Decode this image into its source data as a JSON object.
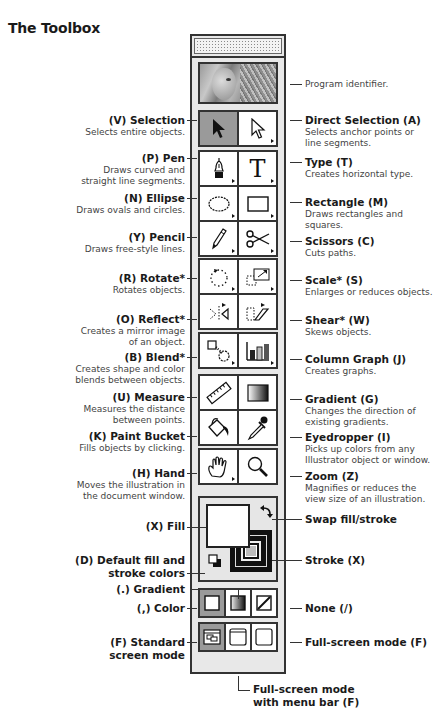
{
  "title": "The Toolbox",
  "program_identifier": "Program identifier.",
  "left_labels": [
    {
      "title": "(V) Selection",
      "desc": [
        "Selects entire objects."
      ]
    },
    {
      "title": "(P) Pen",
      "desc": [
        "Draws curved and",
        "straight line segments."
      ]
    },
    {
      "title": "(N) Ellipse",
      "desc": [
        "Draws ovals and circles."
      ]
    },
    {
      "title": "(Y) Pencil",
      "desc": [
        "Draws free-style lines."
      ]
    },
    {
      "title": "(R) Rotate*",
      "desc": [
        "Rotates objects."
      ]
    },
    {
      "title": "(O) Reflect*",
      "desc": [
        "Creates a mirror image",
        "of an object."
      ]
    },
    {
      "title": "(B) Blend*",
      "desc": [
        "Creates shape and color",
        "blends between objects."
      ]
    },
    {
      "title": "(U) Measure",
      "desc": [
        "Measures the distance",
        "between points."
      ]
    },
    {
      "title": "(K) Paint Bucket",
      "desc": [
        "Fills objects by clicking."
      ]
    },
    {
      "title": "(H) Hand",
      "desc": [
        "Moves the illustration in",
        "the document window."
      ]
    },
    {
      "title": "(X) Fill",
      "desc": []
    },
    {
      "title": "(D) Default fill and",
      "desc": []
    },
    {
      "title": "stroke colors",
      "desc": []
    },
    {
      "title": "(.) Gradient",
      "desc": []
    },
    {
      "title": "(,) Color",
      "desc": []
    },
    {
      "title": "(F) Standard",
      "desc": []
    },
    {
      "title": "screen mode",
      "desc": []
    }
  ],
  "right_labels": [
    {
      "title": "Direct Selection (A)",
      "desc": [
        "Selects anchor points or",
        "line segments."
      ]
    },
    {
      "title": "Type (T)",
      "desc": [
        "Creates horizontal type."
      ]
    },
    {
      "title": "Rectangle (M)",
      "desc": [
        "Draws rectangles and",
        "squares."
      ]
    },
    {
      "title": "Scissors (C)",
      "desc": [
        "Cuts paths."
      ]
    },
    {
      "title": "Scale* (S)",
      "desc": [
        "Enlarges or reduces objects."
      ]
    },
    {
      "title": "Shear* (W)",
      "desc": [
        "Skews objects."
      ]
    },
    {
      "title": "Column Graph (J)",
      "desc": [
        "Creates graphs."
      ]
    },
    {
      "title": "Gradient (G)",
      "desc": [
        "Changes the direction of",
        "existing gradients."
      ]
    },
    {
      "title": "Eyedropper (I)",
      "desc": [
        "Picks up colors from any",
        "Illustrator object or window."
      ]
    },
    {
      "title": "Zoom (Z)",
      "desc": [
        "Magnifies or reduces the",
        "view size of an illustration."
      ]
    },
    {
      "title": "Swap fill/stroke",
      "desc": []
    },
    {
      "title": "Stroke (X)",
      "desc": []
    },
    {
      "title": "None (/)",
      "desc": []
    },
    {
      "title": "Full-screen mode (F)",
      "desc": []
    }
  ],
  "bottom_label": [
    "Full-screen mode",
    "with menu bar (F)"
  ],
  "tools": [
    {
      "name": "selection",
      "icon": "arrow-icon",
      "active": true
    },
    {
      "name": "direct-selection",
      "icon": "hollow-arrow-icon"
    },
    {
      "name": "pen",
      "icon": "pen-nib-icon"
    },
    {
      "name": "type",
      "icon": "type-icon",
      "glyph": "T"
    },
    {
      "name": "ellipse",
      "icon": "ellipse-icon"
    },
    {
      "name": "rectangle",
      "icon": "rectangle-icon"
    },
    {
      "name": "pencil",
      "icon": "pencil-icon"
    },
    {
      "name": "scissors",
      "icon": "scissors-icon",
      "glyph": "✂"
    },
    {
      "name": "rotate",
      "icon": "rotate-icon"
    },
    {
      "name": "scale",
      "icon": "scale-icon"
    },
    {
      "name": "reflect",
      "icon": "reflect-icon"
    },
    {
      "name": "shear",
      "icon": "shear-icon"
    },
    {
      "name": "blend",
      "icon": "blend-icon"
    },
    {
      "name": "column-graph",
      "icon": "column-graph-icon"
    },
    {
      "name": "measure",
      "icon": "ruler-icon"
    },
    {
      "name": "gradient",
      "icon": "gradient-icon"
    },
    {
      "name": "paint-bucket",
      "icon": "paint-bucket-icon"
    },
    {
      "name": "eyedropper",
      "icon": "eyedropper-icon"
    },
    {
      "name": "hand",
      "icon": "hand-icon"
    },
    {
      "name": "zoom",
      "icon": "magnifier-icon"
    }
  ],
  "colors": {
    "active_tool_bg": "#9a9a9a",
    "toolbox_bg": "#e8e8e8",
    "border": "#333333"
  }
}
